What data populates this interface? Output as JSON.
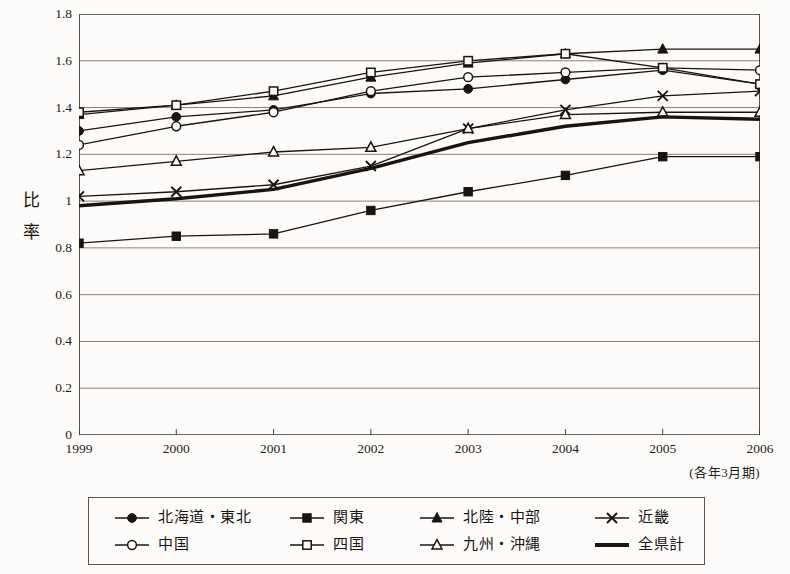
{
  "chart_data": {
    "type": "line",
    "title": "",
    "xlabel": "",
    "ylabel": "比率",
    "x_note": "(各年3月期)",
    "categories": [
      "1999",
      "2000",
      "2001",
      "2002",
      "2003",
      "2004",
      "2005",
      "2006"
    ],
    "ylim": [
      0,
      1.8
    ],
    "y_ticks": [
      "0",
      "0.2",
      "0.4",
      "0.6",
      "0.8",
      "1",
      "1.2",
      "1.4",
      "1.6",
      "1.8"
    ],
    "y_tick_values": [
      0,
      0.2,
      0.4,
      0.6,
      0.8,
      1.0,
      1.2,
      1.4,
      1.6,
      1.8
    ],
    "grid": "horizontal",
    "legend_position": "bottom",
    "series": [
      {
        "name": "北海道・東北",
        "marker": "filled-circle",
        "values": [
          1.3,
          1.36,
          1.39,
          1.46,
          1.48,
          1.52,
          1.56,
          1.5
        ]
      },
      {
        "name": "関東",
        "marker": "filled-square",
        "values": [
          0.82,
          0.85,
          0.86,
          0.96,
          1.04,
          1.11,
          1.19,
          1.19
        ]
      },
      {
        "name": "北陸・中部",
        "marker": "filled-triangle",
        "values": [
          1.37,
          1.41,
          1.45,
          1.53,
          1.59,
          1.63,
          1.65,
          1.65
        ]
      },
      {
        "name": "近畿",
        "marker": "cross",
        "values": [
          1.02,
          1.04,
          1.07,
          1.15,
          1.31,
          1.39,
          1.45,
          1.47
        ]
      },
      {
        "name": "中国",
        "marker": "open-circle",
        "values": [
          1.24,
          1.32,
          1.38,
          1.47,
          1.53,
          1.55,
          1.57,
          1.56
        ]
      },
      {
        "name": "四国",
        "marker": "open-square",
        "values": [
          1.38,
          1.41,
          1.47,
          1.55,
          1.6,
          1.63,
          1.57,
          1.5
        ]
      },
      {
        "name": "九州・沖縄",
        "marker": "open-triangle",
        "values": [
          1.13,
          1.17,
          1.21,
          1.23,
          1.31,
          1.37,
          1.38,
          1.38
        ]
      },
      {
        "name": "全県計",
        "marker": "thick-line",
        "values": [
          0.98,
          1.01,
          1.05,
          1.14,
          1.25,
          1.32,
          1.36,
          1.35
        ]
      }
    ]
  },
  "colors": {
    "line": "#1a1410",
    "grid": "#7b736a",
    "axis": "#3b332b",
    "background": "#fdfcfa",
    "marker_fill": "#1a1410",
    "marker_open": "#fdfcfa"
  },
  "legend": {
    "items": [
      {
        "label": "北海道・東北",
        "marker": "filled-circle"
      },
      {
        "label": "関東",
        "marker": "filled-square"
      },
      {
        "label": "北陸・中部",
        "marker": "filled-triangle"
      },
      {
        "label": "近畿",
        "marker": "cross"
      },
      {
        "label": "中国",
        "marker": "open-circle"
      },
      {
        "label": "四国",
        "marker": "open-square"
      },
      {
        "label": "九州・沖縄",
        "marker": "open-triangle"
      },
      {
        "label": "全県計",
        "marker": "thick-line"
      }
    ]
  }
}
